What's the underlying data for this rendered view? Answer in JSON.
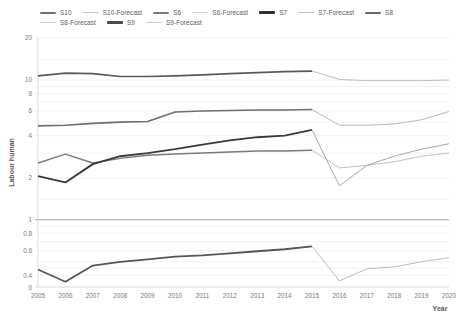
{
  "chart_data": {
    "type": "line",
    "title": "",
    "xlabel": "Year",
    "ylabel": "Labour human",
    "x": [
      2005,
      2006,
      2007,
      2008,
      2009,
      2010,
      2011,
      2012,
      2013,
      2014,
      2015,
      2016,
      2017,
      2018,
      2019,
      2020
    ],
    "xtick_labels": [
      "2005",
      "2006",
      "2007",
      "2008",
      "2009",
      "2010",
      "2011",
      "2012",
      "2013",
      "2014",
      "2015",
      "2016",
      "2017",
      "2018",
      "2019",
      "2020"
    ],
    "yscale": "log",
    "ytick_values": [
      0.4,
      0.6,
      0.8,
      1,
      2,
      4,
      6,
      8,
      10,
      20
    ],
    "ytick_labels": [
      "0.4",
      "0.6",
      "0.8",
      "1",
      "2",
      "4",
      "6",
      "8",
      "10",
      "20"
    ],
    "y_zero_label": "0",
    "ylim": [
      0.33,
      20
    ],
    "grid": true,
    "legend_position": "top",
    "series": [
      {
        "name": "S10",
        "color": "#6f6f6f",
        "width": 1.6,
        "x": [
          2005,
          2006,
          2007,
          2008,
          2009,
          2010,
          2011,
          2012,
          2013,
          2014,
          2015
        ],
        "values": [
          4.7,
          4.75,
          4.9,
          5.0,
          5.05,
          5.9,
          6.0,
          6.05,
          6.1,
          6.1,
          6.15
        ]
      },
      {
        "name": "S10-Forecast",
        "color": "#b9b9b9",
        "width": 1.0,
        "x": [
          2015,
          2016,
          2017,
          2018,
          2019,
          2020
        ],
        "values": [
          6.15,
          4.75,
          4.75,
          4.85,
          5.2,
          5.95
        ]
      },
      {
        "name": "S6",
        "color": "#7b7b7b",
        "width": 1.5,
        "x": [
          2005,
          2006,
          2007,
          2008,
          2009,
          2010,
          2011,
          2012,
          2013,
          2014,
          2015
        ],
        "values": [
          2.55,
          2.95,
          2.55,
          2.75,
          2.9,
          2.95,
          3.0,
          3.05,
          3.1,
          3.1,
          3.15
        ]
      },
      {
        "name": "S6-Forecast",
        "color": "#c3c3c3",
        "width": 1.0,
        "x": [
          2015,
          2016,
          2017,
          2018,
          2019,
          2020
        ],
        "values": [
          3.15,
          2.35,
          2.45,
          2.6,
          2.85,
          3.0
        ]
      },
      {
        "name": "S7",
        "color": "#3a3a3a",
        "width": 1.9,
        "x": [
          2005,
          2006,
          2007,
          2008,
          2009,
          2010,
          2011,
          2012,
          2013,
          2014,
          2015
        ],
        "values": [
          2.05,
          1.85,
          2.5,
          2.85,
          3.0,
          3.2,
          3.45,
          3.7,
          3.9,
          4.0,
          4.4
        ]
      },
      {
        "name": "S7-Forecast",
        "color": "#a8a8a8",
        "width": 1.0,
        "x": [
          2015,
          2016,
          2017,
          2018,
          2019,
          2020
        ],
        "values": [
          4.4,
          1.75,
          2.45,
          2.85,
          3.2,
          3.5
        ]
      },
      {
        "name": "S8",
        "color": "#5a5a5a",
        "width": 1.7,
        "x": [
          2005,
          2006,
          2007,
          2008,
          2009,
          2010,
          2011,
          2012,
          2013,
          2014,
          2015
        ],
        "values": [
          10.7,
          11.2,
          11.1,
          10.6,
          10.6,
          10.7,
          10.9,
          11.1,
          11.3,
          11.5,
          11.6
        ]
      },
      {
        "name": "S8-Forecast",
        "color": "#bdbdbd",
        "width": 1.0,
        "x": [
          2015,
          2016,
          2017,
          2018,
          2019,
          2020
        ],
        "values": [
          11.6,
          10.1,
          9.9,
          9.9,
          9.9,
          10.0
        ]
      },
      {
        "name": "S9",
        "color": "#555555",
        "width": 1.8,
        "x": [
          2005,
          2006,
          2007,
          2008,
          2009,
          2010,
          2011,
          2012,
          2013,
          2014,
          2015
        ],
        "values": [
          0.44,
          0.36,
          0.47,
          0.5,
          0.52,
          0.545,
          0.555,
          0.575,
          0.595,
          0.615,
          0.645
        ]
      },
      {
        "name": "S9-Forecast",
        "color": "#bcbcbc",
        "width": 1.0,
        "x": [
          2015,
          2016,
          2017,
          2018,
          2019,
          2020
        ],
        "values": [
          0.645,
          0.365,
          0.445,
          0.46,
          0.5,
          0.535
        ]
      }
    ]
  },
  "legend": {
    "items": [
      {
        "label": "S10",
        "color": "#6f6f6f",
        "width": 2.0
      },
      {
        "label": "S10-Forecast",
        "color": "#c9c9c9",
        "width": 1.0
      },
      {
        "label": "S6",
        "color": "#7b7b7b",
        "width": 2.0
      },
      {
        "label": "S6-Forecast",
        "color": "#cfcfcf",
        "width": 1.0
      },
      {
        "label": "S7",
        "color": "#303030",
        "width": 2.4
      },
      {
        "label": "S7-Forecast",
        "color": "#bfbfbf",
        "width": 1.0
      },
      {
        "label": "S8",
        "color": "#6a6a6a",
        "width": 2.0
      },
      {
        "label": "S8-Forecast",
        "color": "#cccccc",
        "width": 1.0
      },
      {
        "label": "S9",
        "color": "#4a4a4a",
        "width": 2.4
      },
      {
        "label": "S9-Forecast",
        "color": "#c9c9c9",
        "width": 1.0
      }
    ]
  },
  "axes": {
    "x_title": "Year",
    "y_title": "Labour human"
  }
}
